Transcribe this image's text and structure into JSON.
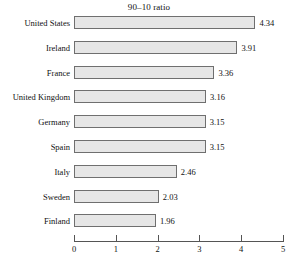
{
  "chart_data": {
    "type": "bar",
    "orientation": "horizontal",
    "title": "90–10 ratio",
    "xlabel": "",
    "ylabel": "",
    "xlim": [
      0,
      5
    ],
    "xticks": [
      0,
      1,
      2,
      3,
      4,
      5
    ],
    "xtick_labels": [
      "0",
      "1",
      "2",
      "3",
      "4",
      "5"
    ],
    "grid": false,
    "legend": false,
    "bar_fill_color": "#e6e6e6",
    "bar_border_color": "#6f6f6f",
    "categories": [
      "United States",
      "Ireland",
      "France",
      "United Kingdom",
      "Germany",
      "Spain",
      "Italy",
      "Sweden",
      "Finland"
    ],
    "values": [
      4.34,
      3.91,
      3.36,
      3.16,
      3.15,
      3.15,
      2.46,
      2.03,
      1.96
    ],
    "value_labels": [
      "4.34",
      "3.91",
      "3.36",
      "3.16",
      "3.15",
      "3.15",
      "2.46",
      "2.03",
      "1.96"
    ]
  }
}
